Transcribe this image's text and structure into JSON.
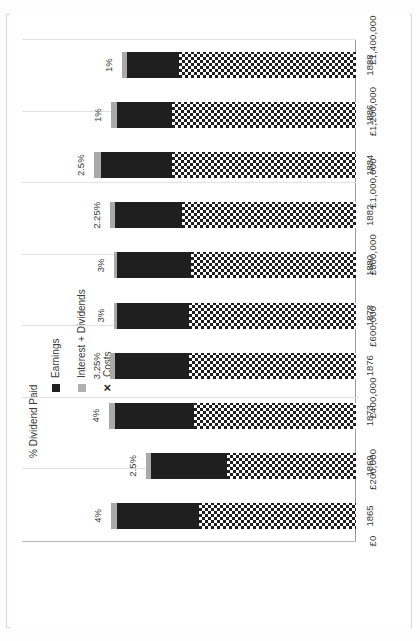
{
  "chart_data": {
    "type": "bar",
    "title": "",
    "xlabel": "",
    "ylabel": "% Dividend Paid",
    "stacked": true,
    "orientation": "horizontal",
    "grid": true,
    "legend_position": "top-right",
    "categories": [
      "1865",
      "1869",
      "1873",
      "1876",
      "1878",
      "1880",
      "1882",
      "1884",
      "1886",
      "1888"
    ],
    "value_axis": {
      "ticks": [
        "£0",
        "£200,000",
        "£400,000",
        "£600,000",
        "£800,000",
        "£1,000,000",
        "£1,200,000",
        "£1,400,000"
      ],
      "tick_values": [
        0,
        200000,
        400000,
        600000,
        800000,
        1000000,
        1200000,
        1400000
      ],
      "min": 0,
      "max": 1400000
    },
    "series": [
      {
        "name": "Earnings",
        "color": "#1f1f1f",
        "values": [
          1000000,
          860000,
          1010000,
          1010000,
          1000000,
          1000000,
          1010000,
          1070000,
          1000000,
          960000
        ]
      },
      {
        "name": "Interest + Dividends",
        "color": "#a9a9a9",
        "values": [
          28000,
          20000,
          25000,
          22000,
          15000,
          14000,
          22000,
          28000,
          26000,
          20000
        ]
      },
      {
        "name": "Costs",
        "color": "#1f1f1f",
        "marker": "checkerboard",
        "values": [
          660000,
          540000,
          680000,
          700000,
          700000,
          690000,
          730000,
          770000,
          770000,
          740000
        ]
      }
    ],
    "point_labels": {
      "name": "% Dividend Paid",
      "values": [
        "4%",
        "2.5%",
        "4%",
        "3.25%",
        "3%",
        "3%",
        "2.25%",
        "2.5%",
        "1%",
        "1%"
      ]
    }
  },
  "legend": {
    "items": [
      {
        "label": "Earnings",
        "marker": "square",
        "color": "#1f1f1f"
      },
      {
        "label": "Interest + Dividends",
        "marker": "square",
        "color": "#b0b0b0"
      },
      {
        "label": "Costs",
        "marker": "cross",
        "glyph": "✕",
        "color": "#1f1f1f"
      }
    ]
  },
  "axis_titles": {
    "category": "% Dividend Paid"
  }
}
